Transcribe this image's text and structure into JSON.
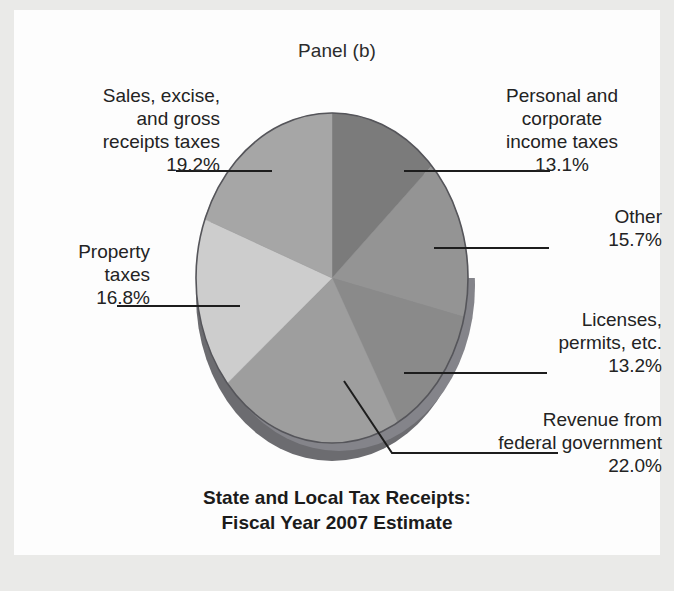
{
  "panel": {
    "label": "Panel (b)"
  },
  "title": {
    "text": "State and Local Tax Receipts:\nFiscal Year 2007 Estimate"
  },
  "chart_data": {
    "type": "pie",
    "title": "State and Local Tax Receipts: Fiscal Year 2007 Estimate",
    "panel": "Panel (b)",
    "unit": "percent",
    "legend_position": "callout-labels",
    "grid": false,
    "start_angle_deg": 0,
    "direction": "clockwise",
    "categories": [
      "Personal and corporate income taxes",
      "Other",
      "Licenses, permits, etc.",
      "Revenue from federal government",
      "Property taxes",
      "Sales, excise, and gross receipts taxes"
    ],
    "values": [
      13.1,
      15.7,
      13.2,
      22.0,
      16.8,
      19.2
    ],
    "slices": [
      {
        "name": "Personal and corporate income taxes",
        "label": "Personal and\ncorporate\nincome taxes",
        "pct_text": "13.1%",
        "value": 13.1,
        "color": "#7b7b7b"
      },
      {
        "name": "Other",
        "label": "Other",
        "pct_text": "15.7%",
        "value": 15.7,
        "color": "#949494"
      },
      {
        "name": "Licenses, permits, etc.",
        "label": "Licenses,\npermits, etc.",
        "pct_text": "13.2%",
        "value": 13.2,
        "color": "#8a8a8a"
      },
      {
        "name": "Revenue from federal government",
        "label": "Revenue from\nfederal government",
        "pct_text": "22.0%",
        "value": 22.0,
        "color": "#9e9e9e"
      },
      {
        "name": "Property taxes",
        "label": "Property\ntaxes",
        "pct_text": "16.8%",
        "value": 16.8,
        "color": "#cdcdcd"
      },
      {
        "name": "Sales, excise, and gross receipts taxes",
        "label": "Sales, excise,\nand gross\nreceipts taxes",
        "pct_text": "19.2%",
        "value": 19.2,
        "color": "#a6a6a6"
      }
    ]
  },
  "labels": {
    "sales": {
      "text": "Sales, excise,\nand gross\nreceipts taxes\n19.2%"
    },
    "property": {
      "text": "Property\ntaxes\n16.8%"
    },
    "personal": {
      "text": "Personal and\ncorporate\nincome taxes\n13.1%"
    },
    "other": {
      "text": "Other\n15.7%"
    },
    "licenses": {
      "text": "Licenses,\npermits, etc.\n13.2%"
    },
    "federal": {
      "text": "Revenue from\nfederal government\n22.0%"
    }
  },
  "colors": {
    "page_background": "#eaeae8",
    "paper": "#fdfdfd",
    "text": "#232323",
    "leader_line": "#1d1d1d",
    "pie_outline": "#55555a",
    "pie_side_wall": "#6f6f73"
  }
}
